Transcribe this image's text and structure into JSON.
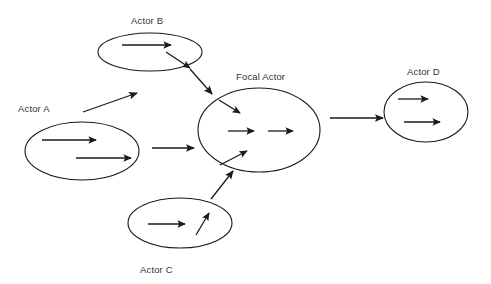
{
  "diagram": {
    "type": "actor-network-influence-diagram",
    "background_color": "#ffffff",
    "stroke_color": "#1a1a1a",
    "label_color": "#333333",
    "labels": {
      "actor_a": "Actor A",
      "actor_b": "Actor B",
      "focal_actor": "Focal Actor",
      "actor_c": "Actor C",
      "actor_d": "Actor D"
    },
    "nodes": [
      {
        "id": "actor_a",
        "label": "Actor A",
        "label_x": 18,
        "label_y": 112,
        "cx": 82,
        "cy": 151,
        "rx": 57,
        "ry": 29,
        "inner_arrows": [
          {
            "x1": 42,
            "y1": 140,
            "x2": 96,
            "y2": 140
          },
          {
            "x1": 76,
            "y1": 158,
            "x2": 131,
            "y2": 158
          }
        ]
      },
      {
        "id": "actor_b",
        "label": "Actor B",
        "label_x": 131,
        "label_y": 24,
        "cx": 150,
        "cy": 52,
        "rx": 52,
        "ry": 19,
        "inner_arrows": [
          {
            "x1": 122,
            "y1": 45,
            "x2": 171,
            "y2": 45
          },
          {
            "x1": 166,
            "y1": 52,
            "x2": 190,
            "y2": 68
          }
        ]
      },
      {
        "id": "focal_actor",
        "label": "Focal Actor",
        "label_x": 236,
        "label_y": 80,
        "cx": 259,
        "cy": 130,
        "rx": 61,
        "ry": 42,
        "inner_arrows": [
          {
            "x1": 219,
            "y1": 100,
            "x2": 240,
            "y2": 113
          },
          {
            "x1": 228,
            "y1": 131,
            "x2": 254,
            "y2": 131
          },
          {
            "x1": 268,
            "y1": 131,
            "x2": 293,
            "y2": 131
          },
          {
            "x1": 220,
            "y1": 165,
            "x2": 247,
            "y2": 151
          }
        ]
      },
      {
        "id": "actor_c",
        "label": "Actor C",
        "label_x": 140,
        "label_y": 273,
        "cx": 180,
        "cy": 223,
        "rx": 52,
        "ry": 25,
        "inner_arrows": [
          {
            "x1": 148,
            "y1": 224,
            "x2": 185,
            "y2": 224
          },
          {
            "x1": 196,
            "y1": 235,
            "x2": 209,
            "y2": 213
          }
        ]
      },
      {
        "id": "actor_d",
        "label": "Actor D",
        "label_x": 407,
        "label_y": 75,
        "cx": 426,
        "cy": 112,
        "rx": 42,
        "ry": 30,
        "inner_arrows": [
          {
            "x1": 398,
            "y1": 99,
            "x2": 428,
            "y2": 99
          },
          {
            "x1": 404,
            "y1": 122,
            "x2": 440,
            "y2": 122
          }
        ]
      }
    ],
    "connectors": [
      {
        "id": "a-to-b",
        "from": "actor_a",
        "to": "actor_b",
        "x1": 83,
        "y1": 112,
        "x2": 137,
        "y2": 93
      },
      {
        "id": "b-to-focal",
        "from": "actor_b",
        "to": "focal_actor",
        "x1": 190,
        "y1": 69,
        "x2": 212,
        "y2": 94
      },
      {
        "id": "a-to-focal",
        "from": "actor_a",
        "to": "focal_actor",
        "x1": 152,
        "y1": 148,
        "x2": 194,
        "y2": 148
      },
      {
        "id": "c-to-focal",
        "from": "actor_c",
        "to": "focal_actor",
        "x1": 211,
        "y1": 199,
        "x2": 233,
        "y2": 171
      },
      {
        "id": "focal-to-d",
        "from": "focal_actor",
        "to": "actor_d",
        "x1": 330,
        "y1": 118,
        "x2": 383,
        "y2": 118
      }
    ]
  }
}
